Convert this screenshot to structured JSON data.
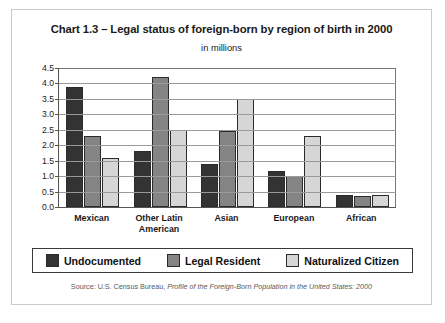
{
  "chart_data": {
    "type": "bar",
    "title": "Chart 1.3 – Legal status of foreign-born by region of birth in 2000",
    "subtitle": "in millions",
    "xlabel": "",
    "ylabel": "in millions",
    "ylim": [
      0.0,
      4.5
    ],
    "ytick_step": 0.5,
    "grid": "horizontal",
    "legend_position": "bottom",
    "categories": [
      "Mexican",
      "Other Latin American",
      "Asian",
      "European",
      "African"
    ],
    "category_lines": [
      [
        "Mexican"
      ],
      [
        "Other Latin",
        "American"
      ],
      [
        "Asian"
      ],
      [
        "European"
      ],
      [
        "African"
      ]
    ],
    "ytick_labels": [
      "4.5",
      "4.0",
      "3.5",
      "3.0",
      "2.5",
      "2.0",
      "1.5",
      "1.0",
      "0.5",
      "0.0"
    ],
    "ytick_values": [
      4.5,
      4.0,
      3.5,
      3.0,
      2.5,
      2.0,
      1.5,
      1.0,
      0.5,
      0.0
    ],
    "series": [
      {
        "name": "Undocumented",
        "color": "#333333",
        "values": [
          3.9,
          1.8,
          1.4,
          1.15,
          0.4
        ]
      },
      {
        "name": "Legal Resident",
        "color": "#848484",
        "values": [
          2.3,
          4.2,
          2.45,
          1.0,
          0.35
        ]
      },
      {
        "name": "Naturalized Citizen",
        "color": "#d6d6d6",
        "values": [
          1.6,
          2.5,
          3.5,
          2.3,
          0.4
        ]
      }
    ],
    "source_prefix": "Source: U.S. Census Bureau, ",
    "source_italic": "Profile of the Foreign-Born Population in the United States: 2000"
  }
}
